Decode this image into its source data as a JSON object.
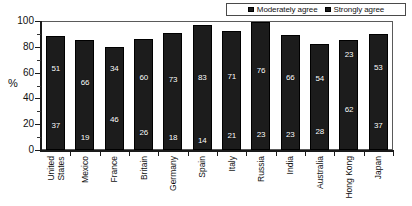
{
  "chart_data": {
    "type": "bar",
    "subtype": "stacked-vertical",
    "title": "",
    "xlabel": "",
    "ylabel": "%",
    "ylim": [
      0,
      100
    ],
    "yticks": [
      0,
      20,
      40,
      60,
      80,
      100
    ],
    "grid": false,
    "legend_position": "top-right",
    "categories": [
      "United States",
      "Mexico",
      "France",
      "Britain",
      "Germany",
      "Spain",
      "Italy",
      "Russia",
      "India",
      "Australia",
      "Hong Kong",
      "Japan"
    ],
    "series": [
      {
        "name": "Moderately agree",
        "color": "#1c1c1c",
        "values": [
          51,
          66,
          34,
          60,
          73,
          83,
          71,
          76,
          66,
          54,
          23,
          53
        ]
      },
      {
        "name": "Strongly agree",
        "color": "#1c1c1c",
        "values": [
          37,
          19,
          46,
          26,
          18,
          14,
          21,
          23,
          23,
          28,
          62,
          37
        ]
      }
    ],
    "totals": [
      88,
      85,
      80,
      86,
      91,
      97,
      92,
      99,
      89,
      82,
      85,
      90
    ]
  },
  "legend": {
    "entries": [
      {
        "label": "Moderately agree",
        "swatch": "legend-swatch-moderately-agree"
      },
      {
        "label": "Strongly agree",
        "swatch": "legend-swatch-strongly-agree"
      }
    ]
  },
  "axis": {
    "y_label": "%",
    "y_ticks": [
      "100",
      "80",
      "60",
      "40",
      "20",
      "0"
    ]
  },
  "x_categories": [
    {
      "line1": "United",
      "line2": "States"
    },
    {
      "line1": "Mexico",
      "line2": ""
    },
    {
      "line1": "France",
      "line2": ""
    },
    {
      "line1": "Britain",
      "line2": ""
    },
    {
      "line1": "Germany",
      "line2": ""
    },
    {
      "line1": "Spain",
      "line2": ""
    },
    {
      "line1": "Italy",
      "line2": ""
    },
    {
      "line1": "Russia",
      "line2": ""
    },
    {
      "line1": "India",
      "line2": ""
    },
    {
      "line1": "Australia",
      "line2": ""
    },
    {
      "line1": "Hong Kong",
      "line2": ""
    },
    {
      "line1": "Japan",
      "line2": ""
    }
  ]
}
